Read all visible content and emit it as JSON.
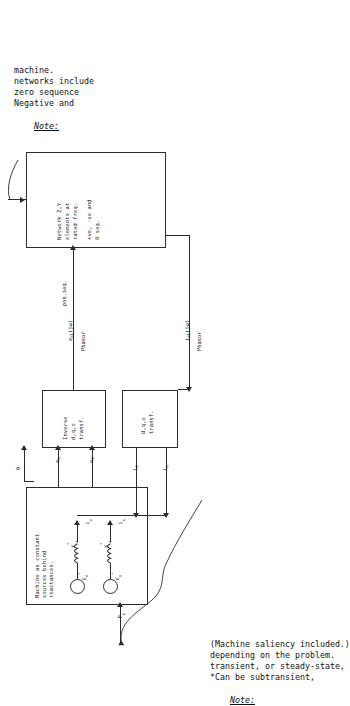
{
  "figure": {
    "orientation": "rotated-90-ccw"
  },
  "blocks": {
    "machine": {
      "name": "machine-block",
      "lines": "Machine as constant\nsources behind\nreactances.",
      "line1": "Machine as constant",
      "line2": "sources behind",
      "line3": "reactances."
    },
    "inverse_transform": {
      "name": "inverse-dqo-transform-block",
      "line1": "Inverse",
      "line2": "d,q,o",
      "line3": "transf."
    },
    "forward_transform": {
      "name": "dqo-transform-block",
      "line1": "d,q,o",
      "line2": "transf."
    },
    "network": {
      "name": "network-block",
      "line1": "Network Z,Y",
      "line2": "elements at",
      "line3": "rated freq.",
      "line4": "+ve, -ve and",
      "line5": "0 seq."
    }
  },
  "circuit": {
    "source_d_label": "E*d",
    "source_d_base": "E",
    "source_d_sub": "d",
    "source_d_sup": "*",
    "source_q_base": "E",
    "source_q_sub": "q",
    "source_q_sup": "*",
    "react_d_base": "X",
    "react_d_sub": "d",
    "react_d_sup": "*",
    "react_q_base": "X",
    "react_q_sub": "q",
    "react_q_sup": "*",
    "current_d_base": "i",
    "current_d_sub": "d",
    "current_q_base": "i",
    "current_q_sub": "q",
    "mech_power_base": "P",
    "mech_power_sub": "m"
  },
  "signals": {
    "e_q": {
      "base": "e",
      "sub": "q"
    },
    "e_d": {
      "base": "e",
      "sub": "d"
    },
    "i_d": {
      "base": "i",
      "sub": "d"
    },
    "i_q": {
      "base": "i",
      "sub": "q"
    },
    "zero": "0",
    "e_a1": {
      "base": "e",
      "sub": "a1",
      "arg": "(jω)"
    },
    "e_a1_kind": "Phasor",
    "e_a1_seq": "pos.seq.",
    "i_a1": {
      "base": "i",
      "sub": "a1",
      "arg": "(jω)"
    },
    "i_a1_kind": "Phasor"
  },
  "notes": {
    "top": {
      "heading": "Note:",
      "line1": "Negative and",
      "line2": "zero sequence",
      "line3": "networks include",
      "line4": "machine."
    },
    "bottom": {
      "heading": "Note:",
      "line1": "*Can be subtransient,",
      "line2": "transient, or steady-state,",
      "line3": "depending on the problem.",
      "line4": "(Machine saliency included.)"
    }
  },
  "colors": {
    "ink": "#2b2b2b",
    "paper": "#ffffff"
  }
}
